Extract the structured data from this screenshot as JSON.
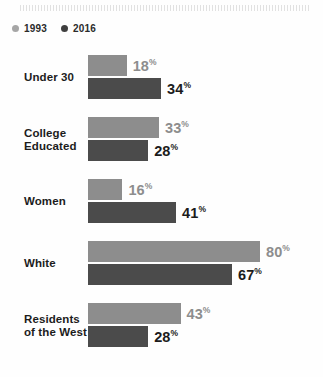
{
  "legend": {
    "items": [
      {
        "label": "1993",
        "color": "#a6a6a6"
      },
      {
        "label": "2016",
        "color": "#3f3f3f"
      }
    ]
  },
  "symbols": {
    "percent": "%"
  },
  "chart_data": {
    "type": "bar",
    "orientation": "horizontal",
    "title": "",
    "subtitle": "",
    "xlabel": "",
    "ylabel": "",
    "xlim": [
      0,
      80
    ],
    "grid": false,
    "legend_position": "top-left",
    "value_suffix": "%",
    "categories": [
      "Under 30",
      "College Educated",
      "Women",
      "White",
      "Residents of the West"
    ],
    "category_lines": [
      [
        "Under 30"
      ],
      [
        "College",
        "Educated"
      ],
      [
        "Women"
      ],
      [
        "White"
      ],
      [
        "Residents",
        "of the West"
      ]
    ],
    "series": [
      {
        "name": "1993",
        "color": "#8d8d8d",
        "values": [
          18,
          33,
          16,
          80,
          43
        ]
      },
      {
        "name": "2016",
        "color": "#4b4b4b",
        "values": [
          34,
          28,
          41,
          67,
          28
        ]
      }
    ],
    "labels": {
      "1993": [
        "18",
        "33",
        "16",
        "80",
        "43"
      ],
      "2016": [
        "34",
        "28",
        "41",
        "67",
        "28"
      ]
    }
  }
}
